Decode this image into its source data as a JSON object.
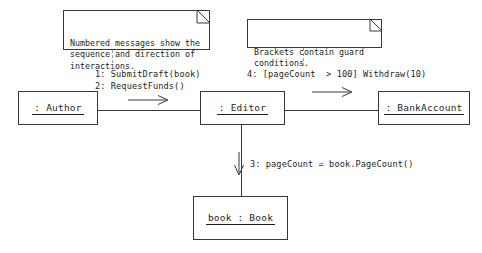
{
  "diagram": {
    "type": "uml-collaboration-diagram",
    "notes": [
      {
        "id": "note-messages",
        "text": "Numbered messages show the\nsequence and direction of\ninteractions."
      },
      {
        "id": "note-brackets",
        "text": "Brackets contain guard\nconditions."
      }
    ],
    "objects": [
      {
        "id": "author",
        "label": ": Author"
      },
      {
        "id": "editor",
        "label": ": Editor"
      },
      {
        "id": "bankaccount",
        "label": ": BankAccount"
      },
      {
        "id": "book",
        "label": "book : Book"
      }
    ],
    "messages": [
      {
        "id": "msg-1",
        "text": "1: SubmitDraft(book)"
      },
      {
        "id": "msg-2",
        "text": "2: RequestFunds()"
      },
      {
        "id": "msg-4",
        "text": "4: [pageCount  > 100] Withdraw(10)"
      },
      {
        "id": "msg-3",
        "text": "3: pageCount = book.PageCount()"
      }
    ],
    "colors": {
      "stroke": "#333a3f",
      "text": "#1b1f23",
      "dashed": "#9aa0a6",
      "background": "#ffffff"
    }
  }
}
